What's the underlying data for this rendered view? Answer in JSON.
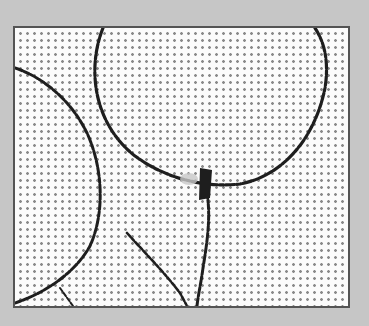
{
  "image": {
    "subject": "balloon outlines halftone illustration",
    "colors": {
      "background": "#c6c6c6",
      "border": "#545454",
      "paper": "#fbfbfb",
      "ink": "#1e1e1e",
      "dots": "#8a8a8a"
    },
    "elements": [
      {
        "name": "large-balloon-outline"
      },
      {
        "name": "left-balloon-outline"
      },
      {
        "name": "balloon-knot"
      },
      {
        "name": "balloon-string-right"
      },
      {
        "name": "balloon-string-left"
      }
    ]
  }
}
